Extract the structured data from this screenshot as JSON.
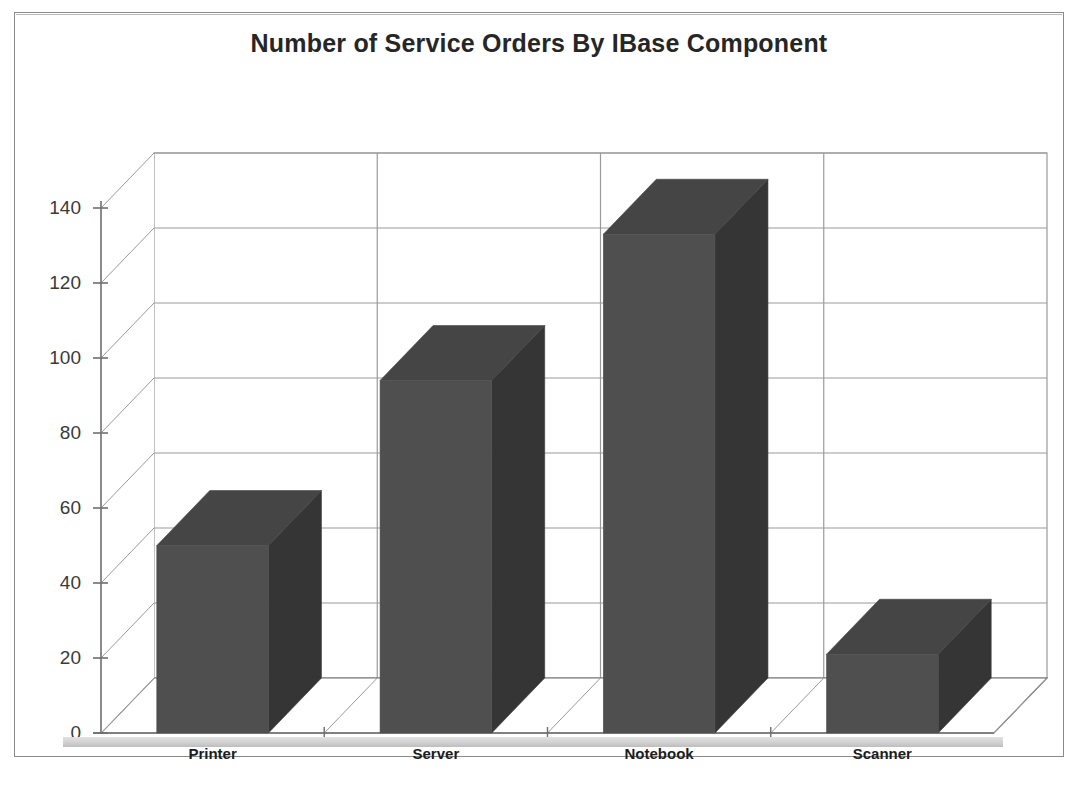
{
  "chart_data": {
    "type": "bar",
    "title": "Number of Service Orders By IBase Component",
    "xlabel": "",
    "ylabel": "",
    "categories": [
      "Printer",
      "Server",
      "Notebook",
      "Scanner"
    ],
    "values": [
      50,
      94,
      133,
      21
    ],
    "ylim": [
      0,
      140
    ],
    "yticks": [
      0,
      20,
      40,
      60,
      80,
      100,
      120,
      140
    ],
    "ytick_labels": [
      "0",
      "20",
      "40",
      "60",
      "80",
      "100",
      "120",
      "140"
    ],
    "grid": true,
    "grid_axis": "y",
    "legend": false,
    "legend_position": "none",
    "style": "3d-column",
    "series": [
      {
        "name": "Number of Service Orders",
        "values": [
          50,
          94,
          133,
          21
        ]
      }
    ],
    "colors": {
      "bar_front": "#4f4f4f",
      "bar_side": "#353535",
      "bar_top": "#454545",
      "grid_line": "#9a9a9a",
      "axis_line": "#6e6e6e",
      "plot_background": "#ffffff",
      "title_color": "#262626",
      "frame_border": "#8a8a8a"
    }
  },
  "frame": {
    "title": "Number of Service Orders By IBase Component"
  }
}
